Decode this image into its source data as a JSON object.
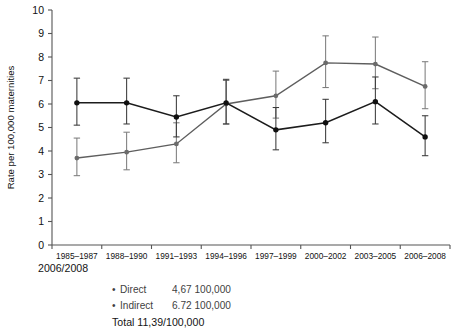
{
  "chart_data": {
    "type": "line",
    "title": "",
    "xlabel": "",
    "ylabel": "Rate per 100,000 maternities",
    "ylim": [
      0,
      10
    ],
    "ytick_values": [
      0,
      1,
      2,
      3,
      4,
      5,
      6,
      7,
      8,
      9,
      10
    ],
    "ytick_labels": [
      "0",
      "1",
      "2",
      "3",
      "4",
      "5",
      "6",
      "7",
      "8",
      "9",
      "10"
    ],
    "grid": false,
    "legend_position": "below-plot",
    "categories": [
      "1985–1987",
      "1988–1990",
      "1991–1993",
      "1994–1996",
      "1997–1999",
      "2000–2002",
      "2003–2005",
      "2006–2008"
    ],
    "series": [
      {
        "name": "Direct",
        "color": "#101010",
        "values": [
          6.05,
          6.05,
          5.45,
          6.05,
          4.9,
          5.2,
          6.1,
          4.6
        ],
        "error_low": [
          5.1,
          5.15,
          4.6,
          5.15,
          4.05,
          4.35,
          5.15,
          3.8
        ],
        "error_high": [
          7.1,
          7.1,
          6.35,
          7.05,
          5.85,
          6.2,
          7.15,
          5.5
        ]
      },
      {
        "name": "Indirect",
        "color": "#6b6b6b",
        "values": [
          3.7,
          3.95,
          4.3,
          6.0,
          6.35,
          7.75,
          7.7,
          6.75
        ],
        "error_low": [
          2.95,
          3.2,
          3.5,
          5.15,
          5.4,
          6.7,
          6.65,
          5.8
        ],
        "error_high": [
          4.55,
          4.8,
          5.2,
          7.0,
          7.4,
          8.9,
          8.85,
          7.8
        ]
      }
    ],
    "annotations": {
      "period_note": "2006/2008",
      "legend": [
        {
          "bullet": "•",
          "name": "Direct",
          "value": "4,67 100,000"
        },
        {
          "bullet": "•",
          "name": "Indirect",
          "value": "6.72 100,000"
        }
      ],
      "total_line": "Total 11,39/100,000"
    }
  }
}
